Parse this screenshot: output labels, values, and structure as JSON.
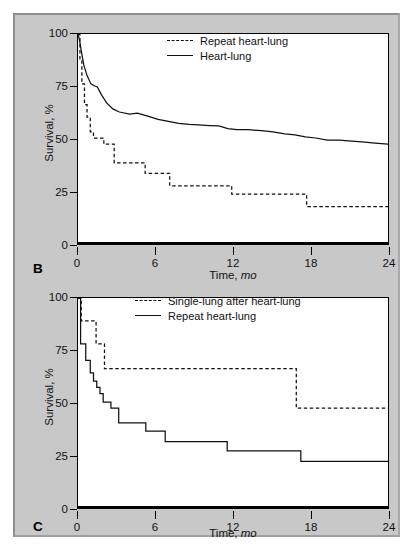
{
  "figure": {
    "background": "#c8c8c8",
    "panels": [
      {
        "letter": "B",
        "ylabel": "Survival, %",
        "xlabel_main": "Time, ",
        "xlabel_italic": "mo",
        "yticks": [
          "0",
          "25",
          "50",
          "75",
          "100"
        ],
        "xticks": [
          "0",
          "6",
          "12",
          "18",
          "24"
        ],
        "legend": [
          {
            "style": "dashed",
            "label": "Repeat heart-lung"
          },
          {
            "style": "solid",
            "label": "Heart-lung"
          }
        ]
      },
      {
        "letter": "C",
        "ylabel": "Survival, %",
        "xlabel_main": "Time, ",
        "xlabel_italic": "mo",
        "yticks": [
          "0",
          "25",
          "50",
          "75",
          "100"
        ],
        "xticks": [
          "0",
          "6",
          "12",
          "18",
          "24"
        ],
        "legend": [
          {
            "style": "dashed",
            "label": "Single-lung after heart-lung"
          },
          {
            "style": "solid",
            "label": "Repeat heart-lung"
          }
        ]
      }
    ]
  },
  "chart_data": [
    {
      "id": "panel-b",
      "type": "line",
      "title": "",
      "panel_label": "B",
      "xlabel": "Time, mo",
      "ylabel": "Survival, %",
      "xlim": [
        0,
        24
      ],
      "ylim": [
        0,
        100
      ],
      "xticks": [
        0,
        6,
        12,
        18,
        24
      ],
      "yticks": [
        0,
        25,
        50,
        75,
        100
      ],
      "grid": false,
      "legend_position": "top-right",
      "series": [
        {
          "name": "Heart-lung",
          "style": "solid",
          "color": "#111111",
          "points": [
            [
              0.0,
              100
            ],
            [
              0.12,
              97
            ],
            [
              0.25,
              92
            ],
            [
              0.45,
              85
            ],
            [
              0.7,
              80
            ],
            [
              1.0,
              76
            ],
            [
              1.3,
              75
            ],
            [
              1.5,
              74.5
            ],
            [
              1.8,
              71
            ],
            [
              2.2,
              67
            ],
            [
              2.7,
              64
            ],
            [
              3.2,
              62.5
            ],
            [
              4.0,
              61.5
            ],
            [
              4.6,
              62
            ],
            [
              5.4,
              60.5
            ],
            [
              6.2,
              59
            ],
            [
              7.0,
              58
            ],
            [
              7.8,
              57
            ],
            [
              8.6,
              56.5
            ],
            [
              9.3,
              56.3
            ],
            [
              10.2,
              56
            ],
            [
              10.9,
              55.8
            ],
            [
              11.6,
              54.5
            ],
            [
              12.3,
              54
            ],
            [
              13.2,
              54
            ],
            [
              14.2,
              53.5
            ],
            [
              15.1,
              53
            ],
            [
              16.0,
              52
            ],
            [
              16.8,
              51.5
            ],
            [
              17.6,
              50.5
            ],
            [
              18.4,
              50
            ],
            [
              19.3,
              49
            ],
            [
              20.2,
              49
            ],
            [
              21.2,
              48.5
            ],
            [
              22.2,
              48
            ],
            [
              23.0,
              47.5
            ],
            [
              24.0,
              47
            ]
          ]
        },
        {
          "name": "Repeat heart-lung",
          "style": "dashed",
          "color": "#111111",
          "step": true,
          "points": [
            [
              0.0,
              100
            ],
            [
              0.15,
              88
            ],
            [
              0.3,
              76
            ],
            [
              0.5,
              66
            ],
            [
              0.7,
              60
            ],
            [
              0.95,
              53
            ],
            [
              1.2,
              50
            ],
            [
              1.8,
              50
            ],
            [
              2.0,
              47
            ],
            [
              2.6,
              47
            ],
            [
              2.8,
              38
            ],
            [
              4.6,
              38
            ],
            [
              5.2,
              33
            ],
            [
              6.9,
              33
            ],
            [
              7.1,
              27
            ],
            [
              11.6,
              27
            ],
            [
              11.9,
              23
            ],
            [
              17.4,
              23
            ],
            [
              17.7,
              17
            ],
            [
              24.0,
              17
            ]
          ]
        }
      ]
    },
    {
      "id": "panel-c",
      "type": "line",
      "title": "",
      "panel_label": "C",
      "xlabel": "Time, mo",
      "ylabel": "Survival, %",
      "xlim": [
        0,
        24
      ],
      "ylim": [
        0,
        100
      ],
      "xticks": [
        0,
        6,
        12,
        18,
        24
      ],
      "yticks": [
        0,
        25,
        50,
        75,
        100
      ],
      "grid": false,
      "legend_position": "top-right",
      "series": [
        {
          "name": "Single-lung after heart-lung",
          "style": "dashed",
          "color": "#111111",
          "step": true,
          "points": [
            [
              0.0,
              100
            ],
            [
              0.25,
              89
            ],
            [
              1.35,
              89
            ],
            [
              1.4,
              78
            ],
            [
              2.0,
              78
            ],
            [
              2.05,
              66
            ],
            [
              16.8,
              66
            ],
            [
              16.9,
              47
            ],
            [
              24.0,
              47
            ]
          ]
        },
        {
          "name": "Repeat heart-lung",
          "style": "solid",
          "color": "#111111",
          "step": true,
          "points": [
            [
              0.0,
              100
            ],
            [
              0.2,
              78
            ],
            [
              0.55,
              78
            ],
            [
              0.6,
              70
            ],
            [
              0.9,
              70
            ],
            [
              0.95,
              64
            ],
            [
              1.15,
              64
            ],
            [
              1.2,
              60
            ],
            [
              1.4,
              60
            ],
            [
              1.45,
              57
            ],
            [
              1.65,
              57
            ],
            [
              1.7,
              54
            ],
            [
              1.9,
              54
            ],
            [
              1.95,
              50
            ],
            [
              2.5,
              50
            ],
            [
              2.55,
              47
            ],
            [
              3.1,
              47
            ],
            [
              3.15,
              40
            ],
            [
              5.2,
              40
            ],
            [
              5.25,
              36
            ],
            [
              6.7,
              36
            ],
            [
              6.75,
              31
            ],
            [
              11.5,
              31
            ],
            [
              11.55,
              26.5
            ],
            [
              17.2,
              26.5
            ],
            [
              17.25,
              21.5
            ],
            [
              24.0,
              21.5
            ]
          ]
        }
      ]
    }
  ]
}
